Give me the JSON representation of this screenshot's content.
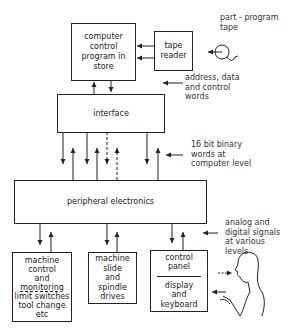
{
  "diagram": {
    "type": "block-diagram",
    "blocks": {
      "computer": {
        "lines": [
          "computer",
          "control",
          "program in",
          "store"
        ]
      },
      "tape_reader": {
        "lines": [
          "tape",
          "reader"
        ]
      },
      "interface": {
        "lines": [
          "interface"
        ]
      },
      "peripheral": {
        "lines": [
          "peripheral electronics"
        ]
      },
      "machine_control": {
        "lines": [
          "machine",
          "control",
          "and",
          "monitoring",
          "limit switches",
          "tool change",
          "etc"
        ]
      },
      "machine_slide": {
        "lines": [
          "machine",
          "slide",
          "and",
          "spindle",
          "drives"
        ]
      },
      "control_panel": {
        "top_lines": [
          "control",
          "panel"
        ],
        "bottom_lines": [
          "display",
          "and",
          "keyboard"
        ]
      }
    },
    "annotations": {
      "tape": [
        "part - program",
        "tape"
      ],
      "address": [
        "address, data",
        "and control",
        "words"
      ],
      "binary": [
        "16 bit binary",
        "words at",
        "computer level"
      ],
      "signals": [
        "analog and",
        "digital signals",
        "at various",
        "levels"
      ]
    },
    "icons": {
      "tape_reel": "tape-reel-icon",
      "operator": "operator-figure-icon"
    }
  }
}
